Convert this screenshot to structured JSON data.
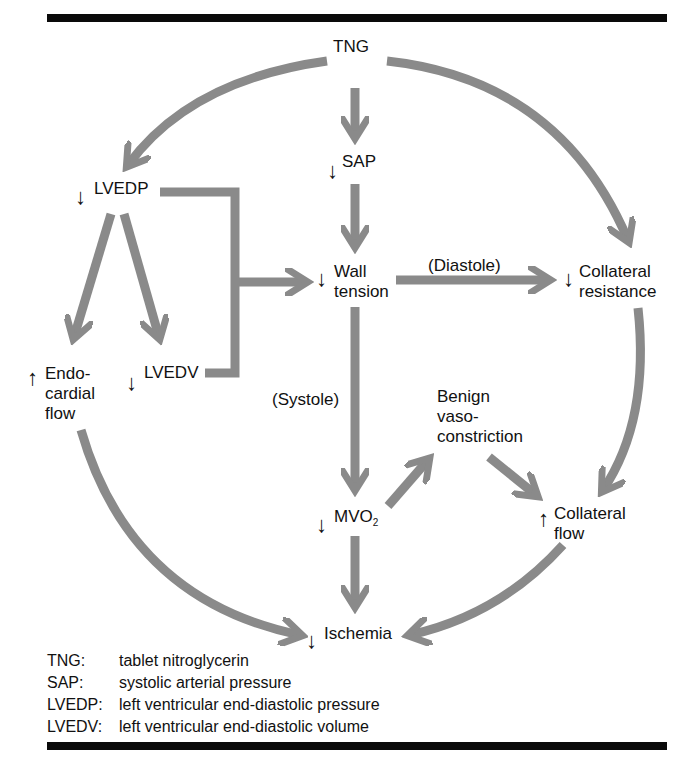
{
  "diagram": {
    "nodes": {
      "tng": {
        "label": "TNG",
        "direction": ""
      },
      "sap": {
        "label": "SAP",
        "direction": "↓"
      },
      "lvedp": {
        "label": "LVEDP",
        "direction": "↓"
      },
      "wall_tension": {
        "line1": "Wall",
        "line2": "tension",
        "direction": "↓"
      },
      "collateral_resistance": {
        "line1": "Collateral",
        "line2": "resistance",
        "direction": "↓"
      },
      "endocardial_flow": {
        "line1": "Endo-",
        "line2": "cardial",
        "line3": "flow",
        "direction": "↑"
      },
      "lvedv": {
        "label": "LVEDV",
        "direction": "↓"
      },
      "benign_vasoconstriction": {
        "line1": "Benign",
        "line2": "vaso-",
        "line3": "constriction",
        "direction": ""
      },
      "mvo2": {
        "label": "MVO",
        "subscript": "2",
        "direction": "↓"
      },
      "collateral_flow": {
        "line1": "Collateral",
        "line2": "flow",
        "direction": "↑"
      },
      "ischemia": {
        "label": "Ischemia",
        "direction": "↓"
      }
    },
    "edge_labels": {
      "diastole": "(Diastole)",
      "systole": "(Systole)"
    },
    "edges": [
      {
        "from": "TNG",
        "to": "SAP"
      },
      {
        "from": "TNG",
        "to": "LVEDP"
      },
      {
        "from": "TNG",
        "to": "Collateral resistance"
      },
      {
        "from": "SAP",
        "to": "Wall tension"
      },
      {
        "from": "LVEDP",
        "to": "Endocardial flow"
      },
      {
        "from": "LVEDP",
        "to": "LVEDV"
      },
      {
        "from": "LVEDP + LVEDV",
        "to": "Wall tension"
      },
      {
        "from": "Wall tension",
        "to": "Collateral resistance",
        "label": "(Diastole)"
      },
      {
        "from": "Wall tension",
        "to": "MVO2",
        "label": "(Systole)"
      },
      {
        "from": "MVO2",
        "to": "Benign vasoconstriction"
      },
      {
        "from": "Benign vasoconstriction",
        "to": "Collateral flow"
      },
      {
        "from": "Collateral resistance",
        "to": "Collateral flow"
      },
      {
        "from": "MVO2",
        "to": "Ischemia"
      },
      {
        "from": "Endocardial flow",
        "to": "Ischemia"
      },
      {
        "from": "Collateral flow",
        "to": "Ischemia"
      }
    ],
    "arrow_color": "#8a8a8a"
  },
  "legend": [
    {
      "abbr": "TNG:",
      "def": "tablet nitroglycerin"
    },
    {
      "abbr": "SAP:",
      "def": "systolic arterial pressure"
    },
    {
      "abbr": "LVEDP:",
      "def": "left ventricular end-diastolic pressure"
    },
    {
      "abbr": "LVEDV:",
      "def": "left ventricular end-diastolic volume"
    }
  ]
}
